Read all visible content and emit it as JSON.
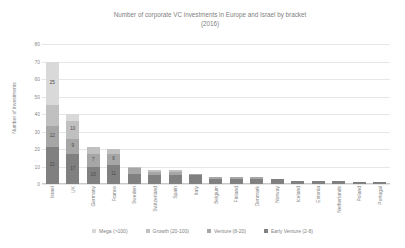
{
  "chart_data": {
    "type": "bar",
    "subtype": "stacked-bar",
    "title": "Number of corporate VC investments in Europe and Israel by bracket (2016)",
    "title_line1": "Number of corporate VC investments in Europe and Israel by bracket",
    "title_line2": "(2016)",
    "xlabel": "",
    "ylabel": "Number of investments",
    "ylim": [
      0,
      80
    ],
    "yticks": [
      0,
      10,
      20,
      30,
      40,
      50,
      60,
      70,
      80
    ],
    "ytick_labels": [
      "0",
      "10",
      "20",
      "30",
      "40",
      "50",
      "60",
      "70",
      "80"
    ],
    "grid": true,
    "legend_position": "bottom",
    "categories": [
      "Israel",
      "UK",
      "Germany",
      "France",
      "Sweden",
      "Switzerland",
      "Spain",
      "Italy",
      "Belgium",
      "Finland",
      "Denmark",
      "Norway",
      "Iceland",
      "Estonia",
      "Netherlands",
      "Poland",
      "Portugal"
    ],
    "series": [
      {
        "name": "Early Venture (2-8)",
        "color": "#808080",
        "values": [
          21,
          17,
          10,
          11,
          6,
          5,
          5,
          5,
          3,
          3,
          3,
          3,
          2,
          2,
          2,
          1,
          1
        ]
      },
      {
        "name": "Venture (8-20)",
        "color": "#a6a6a6",
        "values": [
          12,
          9,
          7,
          6,
          3,
          2,
          2,
          1,
          1,
          1,
          1,
          0,
          0,
          0,
          0,
          0,
          0
        ]
      },
      {
        "name": "Growth (20-100)",
        "color": "#c0c0c0",
        "values": [
          12,
          10,
          4,
          3,
          1,
          1,
          1,
          0,
          0,
          0,
          0,
          0,
          0,
          0,
          0,
          0,
          0
        ]
      },
      {
        "name": "Mega (>100)",
        "color": "#d9d9d9",
        "values": [
          25,
          4,
          0,
          0,
          0,
          0,
          0,
          0,
          0,
          0,
          0,
          0,
          0,
          0,
          0,
          0,
          0
        ]
      }
    ],
    "totals": [
      70,
      40,
      21,
      20,
      10,
      8,
      8,
      6,
      4,
      4,
      4,
      3,
      2,
      2,
      2,
      1,
      1
    ],
    "visible_data_labels": {
      "Israel": {
        "Early Venture (2-8)": "21",
        "Venture (8-20)": "12",
        "Mega (>100)": "25"
      },
      "UK": {
        "Early Venture (2-8)": "17",
        "Venture (8-20)": "9",
        "Growth (20-100)": "10"
      },
      "Germany": {
        "Early Venture (2-8)": "10",
        "Venture (8-20)": "7"
      },
      "France": {
        "Early Venture (2-8)": "11",
        "Venture (8-20)": "6"
      }
    }
  },
  "legend": {
    "items": [
      {
        "label": "Mega (>100)",
        "color": "#d9d9d9"
      },
      {
        "label": "Growth (20-100)",
        "color": "#c0c0c0"
      },
      {
        "label": "Venture (8-20)",
        "color": "#a6a6a6"
      },
      {
        "label": "Early Venture (2-8)",
        "color": "#808080"
      }
    ]
  }
}
